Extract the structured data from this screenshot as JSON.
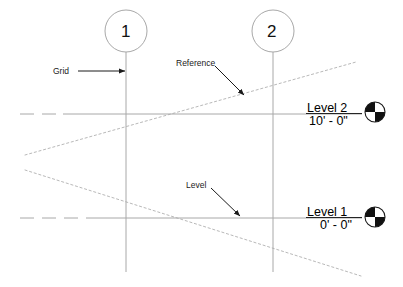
{
  "diagram": {
    "background_color": "#ffffff",
    "line_color": "#9a9a9a",
    "annotation_color": "#222222",
    "level_head_fill": "#000000",
    "width": 403,
    "height": 287
  },
  "grids": [
    {
      "label": "1",
      "x": 126,
      "bubble_cy": 31,
      "bubble_r": 21,
      "line_top": 52,
      "line_bottom": 272
    },
    {
      "label": "2",
      "x": 273,
      "bubble_cy": 31,
      "bubble_r": 21,
      "line_top": 52,
      "line_bottom": 272
    }
  ],
  "levels": [
    {
      "name": "Level 2",
      "elevation": "10' - 0\"",
      "y": 114,
      "line_start_x": 20,
      "line_end_x": 362,
      "head_cx": 375,
      "head_cy": 112,
      "head_r": 10
    },
    {
      "name": "Level 1",
      "elevation": "0' - 0\"",
      "y": 218,
      "line_start_x": 20,
      "line_end_x": 362,
      "head_cx": 375,
      "head_cy": 217,
      "head_r": 10
    }
  ],
  "reference_planes": [
    {
      "x1": 25,
      "y1": 155,
      "x2": 356,
      "y2": 62
    },
    {
      "x1": 25,
      "y1": 170,
      "x2": 361,
      "y2": 276
    }
  ],
  "annotations": [
    {
      "label": "Grid",
      "leader_type": "horizontal-arrow",
      "leader_x1": 78,
      "leader_y1": 71,
      "leader_x2": 125,
      "leader_y2": 71
    },
    {
      "label": "Reference",
      "leader_type": "diagonal-arrow",
      "leader_x1": 215,
      "leader_y1": 66,
      "leader_x2": 244,
      "leader_y2": 95
    },
    {
      "label": "Level",
      "leader_type": "diagonal-arrow",
      "leader_x1": 211,
      "leader_y1": 188,
      "leader_x2": 240,
      "leader_y2": 216
    }
  ]
}
